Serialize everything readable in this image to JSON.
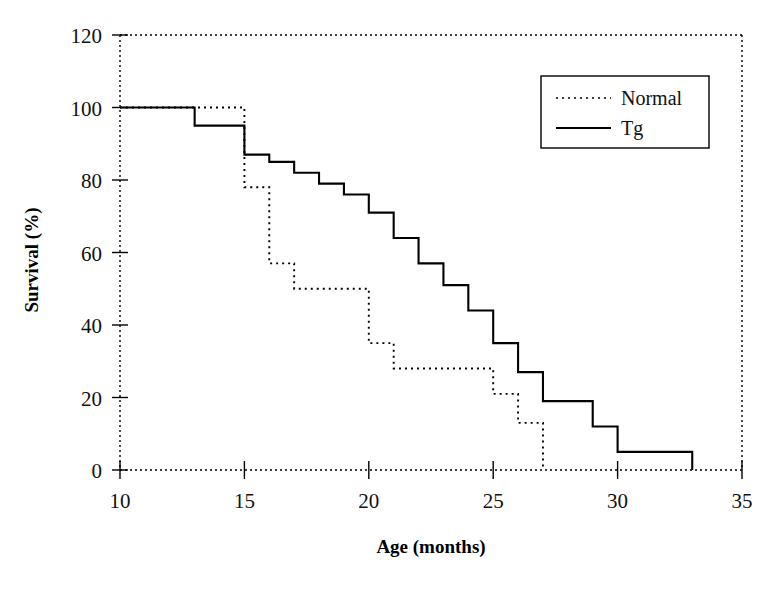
{
  "chart_data": {
    "type": "line",
    "title": "",
    "subtitle": "",
    "xlabel": "Age (months)",
    "ylabel": "Survival (%)",
    "xlim": [
      10,
      35
    ],
    "ylim": [
      0,
      120
    ],
    "xticks": [
      10,
      15,
      20,
      25,
      30,
      35
    ],
    "yticks": [
      0,
      20,
      40,
      60,
      80,
      100,
      120
    ],
    "xtick_labels": [
      "10",
      "15",
      "20",
      "25",
      "30",
      "35"
    ],
    "ytick_labels": [
      "0",
      "20",
      "40",
      "60",
      "80",
      "100",
      "120"
    ],
    "grid": false,
    "legend_position": "top-right",
    "step_style": "post",
    "series": [
      {
        "name": "Normal",
        "linestyle": "dotted",
        "color": "#000000",
        "x": [
          10,
          13,
          15,
          15,
          16,
          17,
          19,
          20,
          21,
          25,
          26,
          27
        ],
        "values": [
          100,
          100,
          100,
          78,
          57,
          50,
          50,
          35,
          28,
          21,
          13,
          7
        ],
        "final_x": 27,
        "final_value": 0
      },
      {
        "name": "Tg",
        "linestyle": "solid",
        "color": "#000000",
        "x": [
          10,
          13,
          15,
          16,
          17,
          18,
          19,
          20,
          21,
          22,
          23,
          24,
          25,
          26,
          27,
          29,
          30,
          33
        ],
        "values": [
          100,
          95,
          87,
          85,
          82,
          79,
          76,
          71,
          64,
          57,
          51,
          44,
          35,
          27,
          19,
          12,
          5,
          2.5
        ],
        "final_x": 33,
        "final_value": 0
      }
    ]
  },
  "legend": {
    "entries": [
      {
        "label": "Normal",
        "style": "dotted"
      },
      {
        "label": "Tg",
        "style": "solid"
      }
    ]
  },
  "axes": {
    "x_title": "Age (months)",
    "y_title": "Survival (%)"
  }
}
